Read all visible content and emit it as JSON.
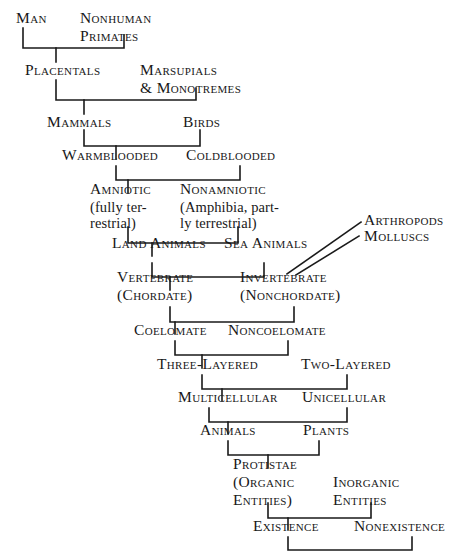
{
  "diagram": {
    "background_color": "#ffffff",
    "line_color": "#1a1a1a",
    "text_color": "#181818",
    "nodes": {
      "man": "Man",
      "nonhuman_primates_l1": "Nonhuman",
      "nonhuman_primates_l2": "Primates",
      "placentals": "Placentals",
      "marsupials_l1": "Marsupials",
      "marsupials_l2": "& Monotremes",
      "mammals": "Mammals",
      "birds": "Birds",
      "warmblooded": "Warmblooded",
      "coldblooded": "Coldblooded",
      "amniotic_l1": "Amniotic",
      "amniotic_l2": "(fully ter-",
      "amniotic_l3": "restrial)",
      "nonamniotic_l1": "Nonamniotic",
      "nonamniotic_l2": "(Amphibia, part-",
      "nonamniotic_l3": "ly terrestrial)",
      "arthropods": "Arthropods",
      "molluscs": "Molluscs",
      "land_animals": "Land Animals",
      "sea_animals": "Sea Animals",
      "vertebrate_l1": "Vertebrate",
      "vertebrate_l2": "(Chordate)",
      "invertebrate_l1": "Invertebrate",
      "invertebrate_l2": "(Nonchordate)",
      "coelomate": "Coelomate",
      "noncoelomate": "Noncoelomate",
      "three_layered": "Three-Layered",
      "two_layered": "Two-Layered",
      "multicellular": "Multicellular",
      "unicellular": "Unicellular",
      "animals": "Animals",
      "plants": "Plants",
      "protistae_l1": "Protistae",
      "protistae_l2": "(Organic",
      "protistae_l3": "Entities)",
      "inorganic_l1": "Inorganic",
      "inorganic_l2": "Entities",
      "existence": "Existence",
      "nonexistence": "Nonexistence"
    }
  }
}
